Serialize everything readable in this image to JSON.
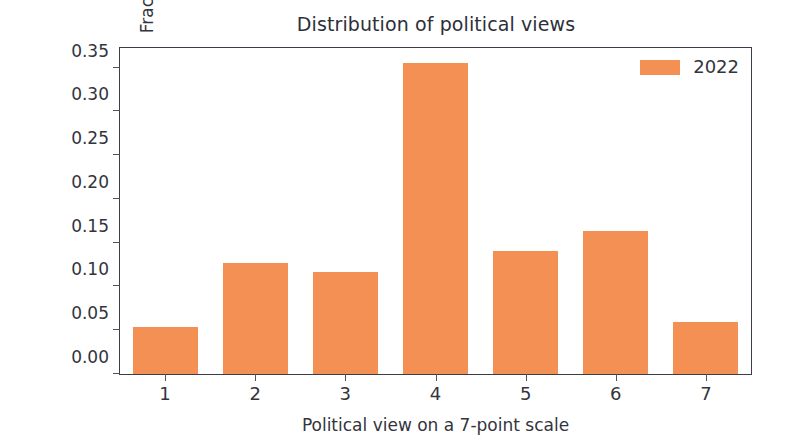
{
  "chart_data": {
    "type": "bar",
    "title": "Distribution of political views",
    "xlabel": "Political view on a 7-point scale",
    "ylabel": "Fraction of respondents",
    "categories": [
      "1",
      "2",
      "3",
      "4",
      "5",
      "6",
      "7"
    ],
    "values": [
      0.054,
      0.127,
      0.117,
      0.355,
      0.14,
      0.163,
      0.06
    ],
    "series": [
      {
        "name": "2022",
        "color": "#f59055",
        "values": [
          0.054,
          0.127,
          0.117,
          0.355,
          0.14,
          0.163,
          0.06
        ]
      }
    ],
    "xlim": [
      0.5,
      7.5
    ],
    "ylim": [
      0.0,
      0.3725
    ],
    "yticks": [
      0.0,
      0.05,
      0.1,
      0.15,
      0.2,
      0.25,
      0.3,
      0.35
    ],
    "ytick_labels": [
      "0.00",
      "0.05",
      "0.10",
      "0.15",
      "0.20",
      "0.25",
      "0.30",
      "0.35"
    ],
    "xticks": [
      1,
      2,
      3,
      4,
      5,
      6,
      7
    ],
    "xtick_labels": [
      "1",
      "2",
      "3",
      "4",
      "5",
      "6",
      "7"
    ],
    "grid": false,
    "legend": {
      "position": "upper right",
      "entries": [
        {
          "label": "2022",
          "color": "#f59055",
          "swatch": "legend-color-swatch"
        }
      ]
    },
    "bar_width_fraction": 0.72,
    "colors": {
      "bar": "#f59055",
      "axis": "#3c3d49",
      "text": "#33343d",
      "background": "#ffffff"
    }
  }
}
